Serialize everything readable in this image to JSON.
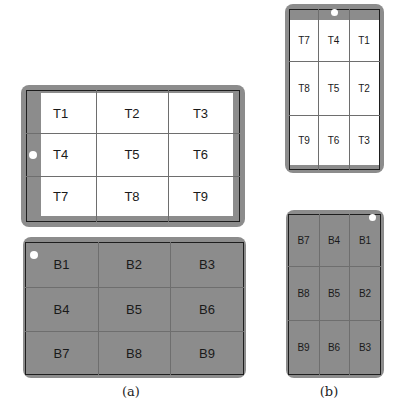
{
  "figure": {
    "panel_a": {
      "caption": "(a)",
      "top_device": {
        "orientation": "landscape",
        "screen": "white",
        "cells": [
          "T1",
          "T2",
          "T3",
          "T4",
          "T5",
          "T6",
          "T7",
          "T8",
          "T9"
        ],
        "dot_position": "left-middle"
      },
      "bottom_device": {
        "orientation": "landscape",
        "screen": "gray",
        "cells": [
          "B1",
          "B2",
          "B3",
          "B4",
          "B5",
          "B6",
          "B7",
          "B8",
          "B9"
        ],
        "dot_position": "top-left"
      }
    },
    "panel_b": {
      "caption": "(b)",
      "top_device": {
        "orientation": "portrait",
        "screen": "white",
        "cells": [
          "T7",
          "T4",
          "T1",
          "T8",
          "T5",
          "T2",
          "T9",
          "T6",
          "T3"
        ],
        "dot_position": "top-middle"
      },
      "bottom_device": {
        "orientation": "portrait",
        "screen": "gray",
        "cells": [
          "B7",
          "B4",
          "B1",
          "B8",
          "B5",
          "B2",
          "B9",
          "B6",
          "B3"
        ],
        "dot_position": "top-right"
      }
    },
    "colors": {
      "device_body": "#8c8c8c",
      "screen_white": "#ffffff",
      "grid_line": "#6e6e6e",
      "border": "#1e1e1e"
    }
  }
}
